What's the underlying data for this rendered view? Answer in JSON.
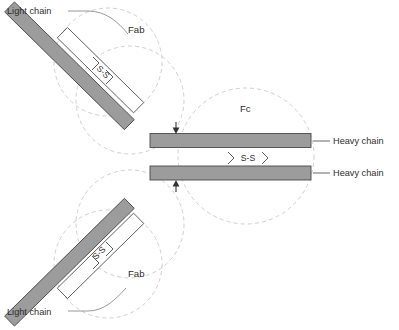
{
  "diagram": {
    "background_color": "#ffffff",
    "width": 399,
    "height": 330,
    "colors": {
      "heavy_chain_fill": "#9c9c9c",
      "heavy_chain_stroke": "#4a4a4a",
      "light_chain_fill": "#ffffff",
      "light_chain_stroke": "#5a5a5a",
      "domain_circle_stroke": "#c9c9c9",
      "leader_line": "#8d8d8d",
      "text": "#2d2d2d"
    },
    "labels": {
      "light_chain_top": "Light chain",
      "light_chain_bottom": "Light chain",
      "heavy_chain_upper": "Heavy chain",
      "heavy_chain_lower": "Heavy chain",
      "fab_top": "Fab",
      "fab_bottom": "Fab",
      "fc": "Fc",
      "disulfide_fab_top": "S-S",
      "disulfide_fab_bottom": "S-S",
      "disulfide_fc": "S-S"
    },
    "regions": [
      {
        "name": "Fab",
        "position": "upper-left",
        "label": "Fab"
      },
      {
        "name": "Fab",
        "position": "lower-left",
        "label": "Fab"
      },
      {
        "name": "Fc",
        "position": "right",
        "label": "Fc"
      }
    ],
    "chains": [
      {
        "name": "heavy-chain-upper",
        "type": "heavy",
        "label": "Heavy chain"
      },
      {
        "name": "heavy-chain-lower",
        "type": "heavy",
        "label": "Heavy chain"
      },
      {
        "name": "light-chain-upper",
        "type": "light",
        "label": "Light chain"
      },
      {
        "name": "light-chain-lower",
        "type": "light",
        "label": "Light chain"
      }
    ],
    "disulfide_bonds": [
      {
        "name": "fab-upper-bond",
        "label": "S-S"
      },
      {
        "name": "fab-lower-bond",
        "label": "S-S"
      },
      {
        "name": "fc-interchain-bond",
        "label": "S-S"
      }
    ],
    "hinge": {
      "name": "hinge-region",
      "annotation": "inward arrows marking hinge",
      "arrow_count": 2
    }
  }
}
